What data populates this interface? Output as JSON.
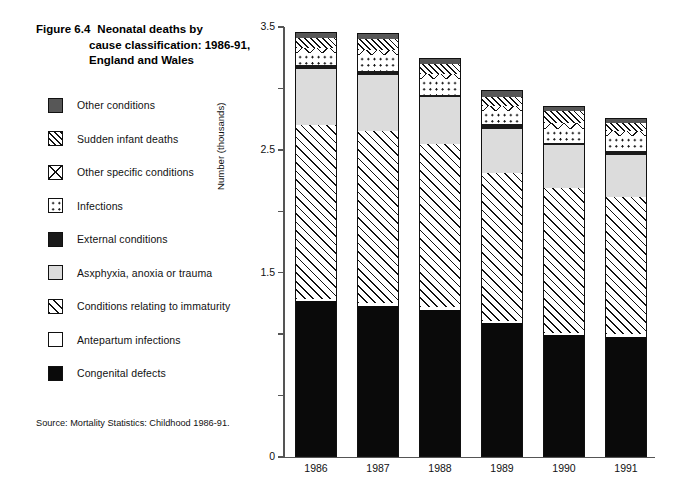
{
  "figure": {
    "number": "Figure 6.4",
    "title_line1": "Neonatal deaths by",
    "title_line2": "cause classification: 1986-91,",
    "title_line3": "England and Wales",
    "source": "Source:  Mortality Statistics: Childhood 1986-91."
  },
  "legend": {
    "items": [
      {
        "label": "Other conditions",
        "pattern": "solid-dark-gray",
        "color": "#575757"
      },
      {
        "label": "Sudden infant deaths",
        "pattern": "diagonal-hatch",
        "color": "#ffffff"
      },
      {
        "label": "Other specific conditions",
        "pattern": "cross-hatch",
        "color": "#ffffff"
      },
      {
        "label": "Infections",
        "pattern": "dotted",
        "color": "#ffffff"
      },
      {
        "label": "External conditions",
        "pattern": "solid-very-dark",
        "color": "#1a1a1a"
      },
      {
        "label": "Asxphyxia, anoxia  or trauma",
        "pattern": "solid-light-gray",
        "color": "#dcdcdc"
      },
      {
        "label": "Conditions relating to  immaturity",
        "pattern": "diagonal-hatch-wide",
        "color": "#ffffff"
      },
      {
        "label": "Antepartum infections",
        "pattern": "solid-white",
        "color": "#ffffff"
      },
      {
        "label": "Congenital defects",
        "pattern": "solid-black",
        "color": "#0a0a0a"
      }
    ]
  },
  "chart_data": {
    "type": "bar",
    "stacked": true,
    "xlabel": "",
    "ylabel": "Number (thousands)",
    "categories": [
      "1986",
      "1987",
      "1988",
      "1989",
      "1990",
      "1991"
    ],
    "ylim": [
      0,
      3.5
    ],
    "yticks": [
      0,
      0.5,
      1.0,
      1.5,
      2.0,
      2.5,
      3.0,
      3.5
    ],
    "ytick_labels": [
      "0",
      "",
      "",
      "1.5",
      "",
      "2.5",
      "",
      "3.5"
    ],
    "grid": false,
    "legend_position": "left",
    "stack_order_bottom_to_top": [
      "Congenital defects",
      "Antepartum infections",
      "Conditions relating to  immaturity",
      "Asxphyxia, anoxia  or trauma",
      "External conditions",
      "Infections",
      "Other specific conditions",
      "Sudden infant deaths",
      "Other conditions"
    ],
    "series": [
      {
        "name": "Congenital defects",
        "values": [
          1.27,
          1.23,
          1.2,
          1.09,
          0.99,
          0.98
        ]
      },
      {
        "name": "Antepartum infections",
        "values": [
          0.02,
          0.02,
          0.02,
          0.02,
          0.02,
          0.02
        ]
      },
      {
        "name": "Conditions relating to  immaturity",
        "values": [
          1.41,
          1.4,
          1.33,
          1.2,
          1.18,
          1.12
        ]
      },
      {
        "name": "Asxphyxia, anoxia  or trauma",
        "values": [
          0.46,
          0.46,
          0.38,
          0.36,
          0.35,
          0.34
        ]
      },
      {
        "name": "External conditions",
        "values": [
          0.03,
          0.03,
          0.02,
          0.04,
          0.02,
          0.03
        ]
      },
      {
        "name": "Infections",
        "values": [
          0.1,
          0.13,
          0.13,
          0.11,
          0.11,
          0.12
        ]
      },
      {
        "name": "Other specific conditions",
        "values": [
          0.04,
          0.04,
          0.04,
          0.04,
          0.05,
          0.04
        ]
      },
      {
        "name": "Sudden infant deaths",
        "values": [
          0.08,
          0.09,
          0.08,
          0.07,
          0.1,
          0.07
        ]
      },
      {
        "name": "Other conditions",
        "values": [
          0.05,
          0.05,
          0.05,
          0.06,
          0.04,
          0.04
        ]
      }
    ],
    "totals": [
      3.46,
      3.45,
      3.25,
      2.99,
      2.86,
      2.76
    ]
  }
}
